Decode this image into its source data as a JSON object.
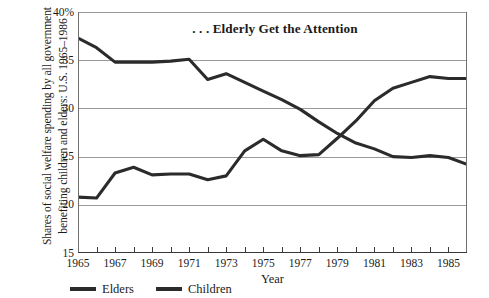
{
  "chart_data": {
    "type": "line",
    "title": ". . . Elderly Get the Attention",
    "ylabel": "Shares of social welfare spending by all government benefiting children and elders: U.S. 1965–1986",
    "xlabel": "Year",
    "x": [
      1965,
      1966,
      1967,
      1968,
      1969,
      1970,
      1971,
      1972,
      1973,
      1974,
      1975,
      1976,
      1977,
      1978,
      1979,
      1980,
      1981,
      1982,
      1983,
      1984,
      1985,
      1986
    ],
    "xticklabels": [
      "1965",
      "1967",
      "1969",
      "1971",
      "1973",
      "1975",
      "1977",
      "1979",
      "1981",
      "1983",
      "1985"
    ],
    "yticklabels": [
      "40%",
      "35",
      "30",
      "25",
      "20",
      "15"
    ],
    "ytickvalues": [
      40,
      35,
      30,
      25,
      20,
      15
    ],
    "ylim": [
      15,
      40
    ],
    "xlim": [
      1965,
      1986
    ],
    "grid": "horizontal",
    "legend_position": "bottom-left",
    "series": [
      {
        "name": "Elders",
        "color": "#2b2b2b",
        "values": [
          37.3,
          36.3,
          34.8,
          34.8,
          34.8,
          34.9,
          35.1,
          33.0,
          33.6,
          32.7,
          31.8,
          30.9,
          29.9,
          28.6,
          27.4,
          26.4,
          25.8,
          25.0,
          24.9,
          25.1,
          24.9,
          24.2
        ]
      },
      {
        "name": "Children",
        "color": "#2b2b2b",
        "values": [
          20.8,
          20.7,
          23.3,
          23.9,
          23.1,
          23.2,
          23.2,
          22.6,
          23.0,
          25.6,
          26.8,
          25.6,
          25.1,
          25.2,
          26.9,
          28.7,
          30.8,
          32.1,
          32.7,
          33.3,
          33.1,
          33.1
        ]
      }
    ]
  }
}
